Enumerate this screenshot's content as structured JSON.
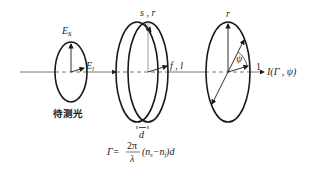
{
  "diagram": {
    "colors": {
      "stroke": "#1a1a1a",
      "axis": "#555555",
      "text": "#222222"
    },
    "left_ellipse": {
      "label_top": "E",
      "label_top_sub": "s",
      "label_right": "E",
      "label_right_sub": "l",
      "caption": "待测光"
    },
    "middle_plate": {
      "label_top": "s , r",
      "label_right": "f , l",
      "thickness_label": "d"
    },
    "right_ellipse": {
      "label_top": "r",
      "angle_label": "ψ",
      "output_mark": "1",
      "output_label": "I(Γ , ψ)"
    },
    "formula": {
      "lhs": "Γ=",
      "numerator": "2π",
      "denominator": "λ",
      "rhs": "(n",
      "n_s_sub": "s",
      "minus": "−n",
      "n_f_sub": "f",
      "tail": ")d"
    }
  }
}
